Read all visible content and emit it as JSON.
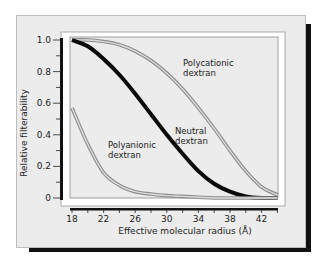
{
  "chart_data": {
    "type": "line",
    "title": "",
    "xlabel": "Effective molecular radius (Å)",
    "ylabel": "Relative filterability",
    "xlim": [
      18,
      44
    ],
    "ylim": [
      0,
      1.0
    ],
    "x_ticks": [
      "18",
      "22",
      "26",
      "30",
      "34",
      "38",
      "42"
    ],
    "y_ticks": [
      "0",
      "0.2",
      "0.4",
      "0.6",
      "0.8",
      "1.0"
    ],
    "grid": false,
    "legend": "none (inline annotations)",
    "series": [
      {
        "name": "Polycationic dextran",
        "style": "gray double line",
        "x": [
          18,
          20,
          22,
          24,
          26,
          28,
          30,
          32,
          34,
          36,
          38,
          40,
          42,
          44
        ],
        "y": [
          1.0,
          1.0,
          0.99,
          0.97,
          0.93,
          0.87,
          0.79,
          0.69,
          0.57,
          0.44,
          0.3,
          0.17,
          0.07,
          0.02
        ]
      },
      {
        "name": "Neutral dextran",
        "style": "thick black line",
        "x": [
          18,
          20,
          22,
          24,
          26,
          28,
          30,
          32,
          34,
          36,
          38,
          40,
          42,
          44
        ],
        "y": [
          1.0,
          0.96,
          0.88,
          0.78,
          0.66,
          0.53,
          0.4,
          0.28,
          0.17,
          0.09,
          0.04,
          0.01,
          0.0,
          0.0
        ]
      },
      {
        "name": "Polyanionic dextran",
        "style": "gray double line",
        "x": [
          18,
          20,
          22,
          24,
          26,
          28,
          30,
          32,
          34,
          36,
          38,
          40,
          42,
          44
        ],
        "y": [
          0.57,
          0.34,
          0.16,
          0.08,
          0.04,
          0.025,
          0.015,
          0.01,
          0.005,
          0.0,
          0.0,
          0.0,
          0.0,
          0.0
        ]
      }
    ],
    "annotations": [
      {
        "text": "Polycationic\ndextran",
        "near_series": "Polycationic dextran"
      },
      {
        "text": "Neutral\ndextran",
        "near_series": "Neutral dextran"
      },
      {
        "text": "Polyanionic\ndextran",
        "near_series": "Polyanionic dextran"
      }
    ]
  },
  "labels": {
    "ylabel": "Relative filterability",
    "xlabel": "Effective molecular radius (Å)",
    "polycationic_1": "Polycationic",
    "polycationic_2": "dextran",
    "neutral_1": "Neutral",
    "neutral_2": "dextran",
    "polyanionic_1": "Polyanionic",
    "polyanionic_2": "dextran"
  }
}
